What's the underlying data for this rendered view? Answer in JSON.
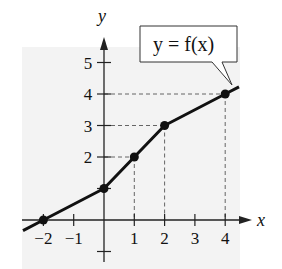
{
  "chart_data": {
    "type": "line",
    "title": "",
    "annotation": "y = f(x)",
    "xlabel": "x",
    "ylabel": "y",
    "x_ticks": [
      -2,
      -1,
      1,
      2,
      3,
      4
    ],
    "x_tick_labels": [
      "−2",
      "−1",
      "1",
      "2",
      "3",
      "4"
    ],
    "y_ticks": [
      2,
      3,
      4,
      5
    ],
    "y_tick_labels": [
      "2",
      "3",
      "4",
      "5"
    ],
    "xlim": [
      -2.2,
      4.5
    ],
    "ylim": [
      -1,
      5.8
    ],
    "grid": false,
    "legend": null,
    "series": [
      {
        "name": "f(x)",
        "x": [
          -2,
          0,
          1,
          2,
          4
        ],
        "y": [
          0,
          1,
          2,
          3,
          4
        ],
        "markers": true
      }
    ],
    "dashed_guides": [
      {
        "x": 1,
        "y": 2
      },
      {
        "x": 2,
        "y": 3
      },
      {
        "x": 4,
        "y": 4
      }
    ],
    "background_shading": "#f2f2f2"
  }
}
